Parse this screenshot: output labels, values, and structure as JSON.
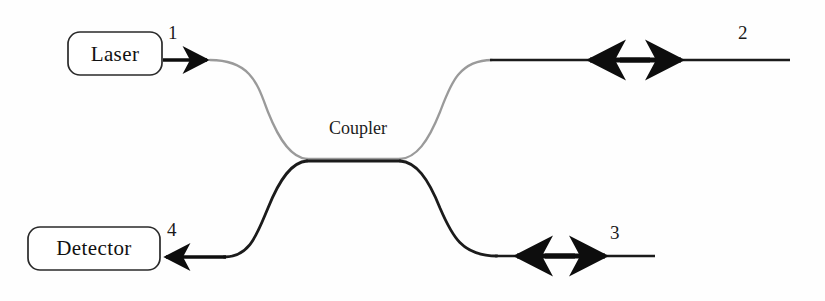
{
  "figure": {
    "background_color": "#fefefe",
    "width": 825,
    "height": 301
  },
  "devices": [
    {
      "id": "laser",
      "label": "Laser",
      "shape": "rounded-rect"
    },
    {
      "id": "detector",
      "label": "Detector",
      "shape": "rounded-rect"
    }
  ],
  "coupler": {
    "label": "Coupler"
  },
  "ports": [
    {
      "id": "port-1",
      "label": "1",
      "arrow": "right",
      "description": "input from laser"
    },
    {
      "id": "port-2",
      "label": "2",
      "arrow": "bidirectional",
      "description": "upper right arm"
    },
    {
      "id": "port-3",
      "label": "3",
      "arrow": "bidirectional",
      "description": "lower right arm"
    },
    {
      "id": "port-4",
      "label": "4",
      "arrow": "left",
      "description": "output to detector"
    }
  ],
  "colors": {
    "fiber_upper": "#9a9a9a",
    "fiber_lower": "#1b1b1b",
    "arrow": "#0d0d0d",
    "box_stroke": "#2a2a2a",
    "text": "#111111"
  }
}
